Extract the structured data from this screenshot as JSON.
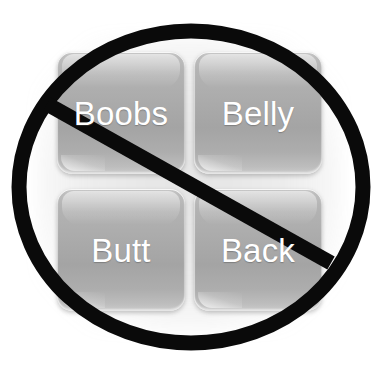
{
  "image": {
    "kind": "prohibition-overlay-graphic",
    "background_color": "#ffffff"
  },
  "tiles": {
    "rows": 2,
    "columns": 2,
    "items": [
      {
        "label": "Boobs",
        "row": 0,
        "column": 0
      },
      {
        "label": "Belly",
        "row": 0,
        "column": 1
      },
      {
        "label": "Butt",
        "row": 1,
        "column": 0
      },
      {
        "label": "Back",
        "row": 1,
        "column": 1
      }
    ],
    "label_color": "#ffffff",
    "tile_color": "#a9a9a9"
  },
  "prohibition_sign": {
    "name": "no-symbol",
    "stroke_color": "#0a0a0a",
    "circle": {
      "cx": 191,
      "cy": 187,
      "rx": 172,
      "ry": 156,
      "stroke_width": 15
    },
    "slash": {
      "x1": 47,
      "y1": 104,
      "x2": 331,
      "y2": 263,
      "stroke_width": 15
    }
  }
}
